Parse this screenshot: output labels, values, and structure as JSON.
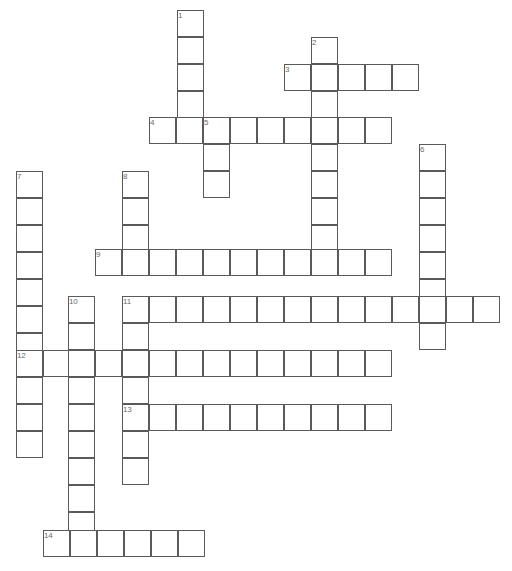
{
  "puzzle": {
    "title": "Crossword Puzzle Grid",
    "cell_size": 27,
    "grid_origin_x": 16,
    "grid_origin_y": 10,
    "background_color": "#ffffff",
    "cell_border_color": "#5a5a5a",
    "number_color": "#6b6b6b",
    "canvas_width": 512,
    "canvas_height": 571,
    "entry_count": 14,
    "entries": [
      {
        "number": "1",
        "direction": "down",
        "length": 4,
        "x": 177,
        "y": 10,
        "answer": ""
      },
      {
        "number": "2",
        "direction": "down",
        "length": 9,
        "x": 311,
        "y": 37,
        "answer": ""
      },
      {
        "number": "3",
        "direction": "across",
        "length": 5,
        "x": 284,
        "y": 64,
        "answer": ""
      },
      {
        "number": "4",
        "direction": "across",
        "length": 9,
        "x": 149,
        "y": 117,
        "answer": ""
      },
      {
        "number": "5",
        "direction": "down",
        "length": 3,
        "x": 203,
        "y": 117,
        "answer": ""
      },
      {
        "number": "6",
        "direction": "down",
        "length": 8,
        "x": 419,
        "y": 144,
        "answer": ""
      },
      {
        "number": "7",
        "direction": "down",
        "length": 11,
        "x": 16,
        "y": 171,
        "answer": ""
      },
      {
        "number": "8",
        "direction": "down",
        "length": 12,
        "x": 122,
        "y": 171,
        "answer": ""
      },
      {
        "number": "9",
        "direction": "across",
        "length": 11,
        "x": 95,
        "y": 249,
        "answer": ""
      },
      {
        "number": "10",
        "direction": "down",
        "length": 9,
        "x": 68,
        "y": 296,
        "answer": ""
      },
      {
        "number": "11",
        "direction": "across",
        "length": 14,
        "x": 122,
        "y": 296,
        "answer": ""
      },
      {
        "number": "12",
        "direction": "across",
        "length": 12,
        "x": 16,
        "y": 350,
        "answer": ""
      },
      {
        "number": "13",
        "direction": "across",
        "length": 10,
        "x": 122,
        "y": 404,
        "answer": ""
      },
      {
        "number": "14",
        "direction": "across",
        "length": 6,
        "x": 43,
        "y": 530,
        "answer": ""
      }
    ],
    "cells": [
      {
        "x": 177,
        "y": 10,
        "num": "1"
      },
      {
        "x": 177,
        "y": 37
      },
      {
        "x": 177,
        "y": 64
      },
      {
        "x": 177,
        "y": 91
      },
      {
        "x": 311,
        "y": 37,
        "num": "2"
      },
      {
        "x": 284,
        "y": 64,
        "num": "3"
      },
      {
        "x": 311,
        "y": 64
      },
      {
        "x": 338,
        "y": 64
      },
      {
        "x": 365,
        "y": 64
      },
      {
        "x": 392,
        "y": 64
      },
      {
        "x": 311,
        "y": 91
      },
      {
        "x": 149,
        "y": 117,
        "num": "4"
      },
      {
        "x": 176,
        "y": 117
      },
      {
        "x": 203,
        "y": 117,
        "num": "5"
      },
      {
        "x": 230,
        "y": 117
      },
      {
        "x": 257,
        "y": 117
      },
      {
        "x": 284,
        "y": 117
      },
      {
        "x": 311,
        "y": 117
      },
      {
        "x": 338,
        "y": 117
      },
      {
        "x": 365,
        "y": 117
      },
      {
        "x": 203,
        "y": 144
      },
      {
        "x": 203,
        "y": 171
      },
      {
        "x": 311,
        "y": 144
      },
      {
        "x": 419,
        "y": 144,
        "num": "6"
      },
      {
        "x": 311,
        "y": 171
      },
      {
        "x": 419,
        "y": 171
      },
      {
        "x": 16,
        "y": 171,
        "num": "7"
      },
      {
        "x": 122,
        "y": 171,
        "num": "8"
      },
      {
        "x": 16,
        "y": 198
      },
      {
        "x": 122,
        "y": 198
      },
      {
        "x": 311,
        "y": 198
      },
      {
        "x": 419,
        "y": 198
      },
      {
        "x": 16,
        "y": 225
      },
      {
        "x": 122,
        "y": 225
      },
      {
        "x": 311,
        "y": 225
      },
      {
        "x": 419,
        "y": 225
      },
      {
        "x": 95,
        "y": 249,
        "num": "9"
      },
      {
        "x": 122,
        "y": 249
      },
      {
        "x": 149,
        "y": 249
      },
      {
        "x": 176,
        "y": 249
      },
      {
        "x": 203,
        "y": 249
      },
      {
        "x": 230,
        "y": 249
      },
      {
        "x": 257,
        "y": 249
      },
      {
        "x": 284,
        "y": 249
      },
      {
        "x": 311,
        "y": 249
      },
      {
        "x": 338,
        "y": 249
      },
      {
        "x": 365,
        "y": 249
      },
      {
        "x": 419,
        "y": 252
      },
      {
        "x": 16,
        "y": 252
      },
      {
        "x": 16,
        "y": 279
      },
      {
        "x": 419,
        "y": 279
      },
      {
        "x": 68,
        "y": 296,
        "num": "10"
      },
      {
        "x": 122,
        "y": 296,
        "num": "11"
      },
      {
        "x": 149,
        "y": 296
      },
      {
        "x": 176,
        "y": 296
      },
      {
        "x": 203,
        "y": 296
      },
      {
        "x": 230,
        "y": 296
      },
      {
        "x": 257,
        "y": 296
      },
      {
        "x": 284,
        "y": 296
      },
      {
        "x": 311,
        "y": 296
      },
      {
        "x": 338,
        "y": 296
      },
      {
        "x": 365,
        "y": 296
      },
      {
        "x": 392,
        "y": 296
      },
      {
        "x": 419,
        "y": 296
      },
      {
        "x": 446,
        "y": 296
      },
      {
        "x": 473,
        "y": 296
      },
      {
        "x": 16,
        "y": 306
      },
      {
        "x": 68,
        "y": 323
      },
      {
        "x": 122,
        "y": 323
      },
      {
        "x": 419,
        "y": 323
      },
      {
        "x": 16,
        "y": 333
      },
      {
        "x": 16,
        "y": 350,
        "num": "12"
      },
      {
        "x": 43,
        "y": 350
      },
      {
        "x": 68,
        "y": 350
      },
      {
        "x": 95,
        "y": 350
      },
      {
        "x": 122,
        "y": 350
      },
      {
        "x": 149,
        "y": 350
      },
      {
        "x": 176,
        "y": 350
      },
      {
        "x": 203,
        "y": 350
      },
      {
        "x": 230,
        "y": 350
      },
      {
        "x": 257,
        "y": 350
      },
      {
        "x": 284,
        "y": 350
      },
      {
        "x": 311,
        "y": 350
      },
      {
        "x": 338,
        "y": 350
      },
      {
        "x": 365,
        "y": 350
      },
      {
        "x": 16,
        "y": 377
      },
      {
        "x": 68,
        "y": 377
      },
      {
        "x": 122,
        "y": 377
      },
      {
        "x": 16,
        "y": 404
      },
      {
        "x": 68,
        "y": 404
      },
      {
        "x": 122,
        "y": 404,
        "num": "13"
      },
      {
        "x": 149,
        "y": 404
      },
      {
        "x": 176,
        "y": 404
      },
      {
        "x": 203,
        "y": 404
      },
      {
        "x": 230,
        "y": 404
      },
      {
        "x": 257,
        "y": 404
      },
      {
        "x": 284,
        "y": 404
      },
      {
        "x": 311,
        "y": 404
      },
      {
        "x": 338,
        "y": 404
      },
      {
        "x": 365,
        "y": 404
      },
      {
        "x": 16,
        "y": 431
      },
      {
        "x": 68,
        "y": 431
      },
      {
        "x": 122,
        "y": 431
      },
      {
        "x": 68,
        "y": 458
      },
      {
        "x": 122,
        "y": 458
      },
      {
        "x": 68,
        "y": 485
      },
      {
        "x": 68,
        "y": 512
      },
      {
        "x": 43,
        "y": 530,
        "num": "14"
      },
      {
        "x": 70,
        "y": 530
      },
      {
        "x": 97,
        "y": 530
      },
      {
        "x": 124,
        "y": 530
      },
      {
        "x": 151,
        "y": 530
      },
      {
        "x": 178,
        "y": 530
      }
    ]
  }
}
